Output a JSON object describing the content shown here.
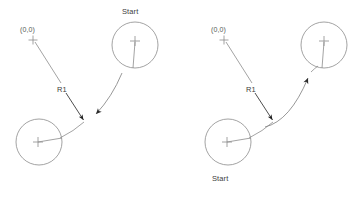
{
  "figure": {
    "background_color": "#ffffff",
    "line_color": "#8c8c8c",
    "accent_color": "#2b2b2b",
    "text_color": "#4a4a4a",
    "width": 354,
    "height": 197,
    "panel_count": 2
  },
  "panels": [
    {
      "id": "left",
      "name": "clockwise-motion-panel",
      "origin_label": "(0,0)",
      "start_label": "Start",
      "radius_label": "R1",
      "start_position": "top-right",
      "end_position": "bottom-left",
      "arc_direction": "to-bottom-left",
      "origin_marker": {
        "x": 33,
        "y": 40,
        "size": 9
      },
      "circles": [
        {
          "name": "start-circle",
          "cx": 135,
          "cy": 45,
          "r": 23,
          "spoke_angle_deg": 90
        },
        {
          "name": "end-circle",
          "cx": 39,
          "cy": 142,
          "r": 23,
          "spoke_angle_deg": 0
        }
      ],
      "origin_leader": {
        "x1": 35,
        "y1": 42,
        "x2": 60,
        "y2": 82
      },
      "radius_leader": {
        "x1": 66,
        "y1": 94,
        "x2": 84,
        "y2": 122
      },
      "arc": {
        "from_x": 121,
        "from_y": 72,
        "to_x": 94,
        "to_y": 118,
        "arrow_at": "end"
      }
    },
    {
      "id": "right",
      "name": "counterclockwise-motion-panel",
      "origin_label": "(0,0)",
      "start_label": "Start",
      "radius_label": "R1",
      "start_position": "bottom-left",
      "end_position": "top-right",
      "arc_direction": "to-top-right",
      "origin_marker": {
        "x": 224,
        "y": 40,
        "size": 9
      },
      "circles": [
        {
          "name": "end-circle",
          "cx": 324,
          "cy": 45,
          "r": 23,
          "spoke_angle_deg": 90
        },
        {
          "name": "start-circle",
          "cx": 228,
          "cy": 142,
          "r": 23,
          "spoke_angle_deg": 0
        }
      ],
      "origin_leader": {
        "x1": 226,
        "y1": 42,
        "x2": 251,
        "y2": 82
      },
      "radius_leader": {
        "x1": 255,
        "y1": 94,
        "x2": 273,
        "y2": 122
      },
      "arc": {
        "from_x": 262,
        "from_y": 126,
        "to_x": 310,
        "to_y": 74,
        "arrow_at": "end"
      }
    }
  ]
}
